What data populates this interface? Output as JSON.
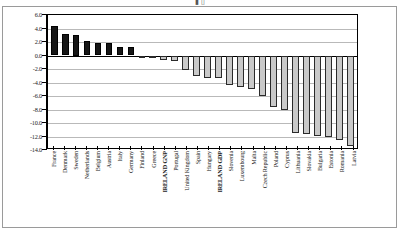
{
  "page": {
    "top_fragment": "▮                                        ▯"
  },
  "chart_data": {
    "type": "bar",
    "title": "",
    "subtitle": "",
    "xlabel": "",
    "ylabel": "",
    "ylim": [
      -14.0,
      6.0
    ],
    "ytick_step": 2.0,
    "grid": true,
    "legend": false,
    "legend_position": "none",
    "orientation": "vertical",
    "label_rotation": -90,
    "colors": {
      "positive_bar": "#161616",
      "negative_bar": "#c9c9c9",
      "negative_bar_outline": "#2a2a2a",
      "gridline": "#b9b9b9",
      "axis": "#000000"
    },
    "ytick_labels": [
      "6.0",
      "4.0",
      "2.0",
      "0.0",
      "-2.0",
      "-4.0",
      "-6.0",
      "-8.0",
      "-10.0",
      "-12.0",
      "-14.0"
    ],
    "ytick_values": [
      6.0,
      4.0,
      2.0,
      0.0,
      -2.0,
      -4.0,
      -6.0,
      -8.0,
      -10.0,
      -12.0,
      -14.0
    ],
    "categories": [
      "France",
      "Denmark",
      "Sweden",
      "Netherlands",
      "Belgium",
      "Austria",
      "Italy",
      "Germany",
      "Finland",
      "Greece",
      "IRELAND GNP",
      "Portugal",
      "United Kingdom",
      "Spain",
      "Hungary",
      "IRELAND GDP",
      "Slovenia",
      "Luxembourg",
      "Malta",
      "Czech Republic",
      "Poland",
      "Cyprus",
      "Lithuania",
      "Slovakia",
      "Bulgaria",
      "Estonia",
      "Romania",
      "Latvia"
    ],
    "emphasis_categories": [
      "IRELAND GNP",
      "IRELAND GDP"
    ],
    "values": [
      4.3,
      3.2,
      3.0,
      2.1,
      1.9,
      1.8,
      1.2,
      1.2,
      -0.1,
      -0.3,
      -0.7,
      -0.8,
      -2.2,
      -3.0,
      -3.3,
      -3.4,
      -4.3,
      -4.6,
      -5.0,
      -6.0,
      -7.6,
      -8.0,
      -11.5,
      -11.7,
      -11.9,
      -12.1,
      -12.5,
      -13.4
    ]
  }
}
